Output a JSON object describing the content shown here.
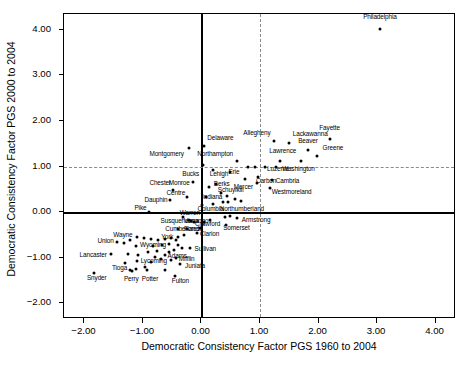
{
  "chart_data": {
    "type": "scatter",
    "title": "",
    "xlabel": "Democratic Consistency Factor PGS 1960 to 2004",
    "ylabel": "Democratic Consistency Factor PGS 2000 to 2004",
    "xlim": [
      -2.35,
      4.35
    ],
    "ylim": [
      -2.35,
      4.35
    ],
    "xticks": [
      -2.0,
      -1.0,
      0.0,
      1.0,
      2.0,
      3.0,
      4.0
    ],
    "xticklabels": [
      "-2.00",
      "-1.00",
      "0.00",
      "1.00",
      "2.00",
      "3.00",
      "4.00"
    ],
    "yticks": [
      -2.0,
      -1.0,
      0.0,
      1.0,
      2.0,
      3.0,
      4.0
    ],
    "yticklabels": [
      "-2.00",
      "-1.00",
      "0.00",
      "1.00",
      "2.00",
      "3.00",
      "4.00"
    ],
    "grid": false,
    "legend": null,
    "reference_lines": [
      {
        "axis": "x",
        "value": 0.0,
        "style": "solid",
        "color": "#000000"
      },
      {
        "axis": "y",
        "value": 0.0,
        "style": "solid",
        "color": "#000000"
      },
      {
        "axis": "x",
        "value": 1.0,
        "style": "dashed",
        "color": "#8a8a8a"
      },
      {
        "axis": "y",
        "value": 1.0,
        "style": "dashed",
        "color": "#8a8a8a"
      }
    ],
    "marker": {
      "shape": "circle",
      "color": "#000000",
      "size": 3
    },
    "points": [
      {
        "label": "Philadelphia",
        "x": 3.05,
        "y": 4.03,
        "lx": 3.05,
        "ly": 4.27,
        "anchor": "center"
      },
      {
        "label": "Fayette",
        "x": 2.19,
        "y": 1.61,
        "lx": 2.19,
        "ly": 1.84,
        "anchor": "center"
      },
      {
        "label": "Lackawanna",
        "x": 1.5,
        "y": 1.52,
        "lx": 1.56,
        "ly": 1.72,
        "anchor": "left"
      },
      {
        "label": "Allegheny",
        "x": 1.24,
        "y": 1.57,
        "lx": 1.18,
        "ly": 1.74,
        "anchor": "right"
      },
      {
        "label": "Beaver",
        "x": 1.82,
        "y": 1.37,
        "lx": 1.82,
        "ly": 1.56,
        "anchor": "center"
      },
      {
        "label": "Greene",
        "x": 1.97,
        "y": 1.22,
        "lx": 2.07,
        "ly": 1.4,
        "anchor": "left"
      },
      {
        "label": "Lawrence",
        "x": 1.7,
        "y": 1.12,
        "lx": 1.62,
        "ly": 1.33,
        "anchor": "right"
      },
      {
        "label": "Delaware",
        "x": 0.04,
        "y": 1.44,
        "lx": 0.1,
        "ly": 1.62,
        "anchor": "left"
      },
      {
        "label": "Montgomery",
        "x": -0.22,
        "y": 1.4,
        "lx": -0.3,
        "ly": 1.26,
        "anchor": "right"
      },
      {
        "label": "Northampton",
        "x": 0.6,
        "y": 1.13,
        "lx": 0.54,
        "ly": 1.28,
        "anchor": "right"
      },
      {
        "label": "Luzerne",
        "x": 1.08,
        "y": 1.0,
        "lx": 1.12,
        "ly": 0.94,
        "anchor": "left"
      },
      {
        "label": "Washington",
        "x": 1.28,
        "y": 0.99,
        "lx": 1.38,
        "ly": 0.94,
        "anchor": "left"
      },
      {
        "label": "Bucks",
        "x": 0.03,
        "y": 1.03,
        "lx": -0.04,
        "ly": 0.83,
        "anchor": "right"
      },
      {
        "label": "Lehigh",
        "x": 0.2,
        "y": 0.92,
        "lx": 0.14,
        "ly": 0.83,
        "anchor": "left"
      },
      {
        "label": "Erie",
        "x": 0.49,
        "y": 0.88,
        "lx": 0.46,
        "ly": 0.88,
        "anchor": "left"
      },
      {
        "label": "Carbon",
        "x": 0.97,
        "y": 0.77,
        "lx": 0.93,
        "ly": 0.68,
        "anchor": "left"
      },
      {
        "label": "Cambria",
        "x": 1.21,
        "y": 0.71,
        "lx": 1.27,
        "ly": 0.68,
        "anchor": "left"
      },
      {
        "label": "Mercer",
        "x": 0.95,
        "y": 0.63,
        "lx": 0.88,
        "ly": 0.55,
        "anchor": "right"
      },
      {
        "label": "Westmoreland",
        "x": 1.17,
        "y": 0.53,
        "lx": 1.2,
        "ly": 0.44,
        "anchor": "left"
      },
      {
        "label": "Monroe",
        "x": -0.14,
        "y": 0.66,
        "lx": -0.2,
        "ly": 0.63,
        "anchor": "right"
      },
      {
        "label": "Chester",
        "x": -0.49,
        "y": 0.48,
        "lx": -0.52,
        "ly": 0.63,
        "anchor": "right"
      },
      {
        "label": "Berks",
        "x": 0.24,
        "y": 0.62,
        "lx": 0.21,
        "ly": 0.62,
        "anchor": "left"
      },
      {
        "label": "Schuylkill",
        "x": 0.13,
        "y": 0.55,
        "lx": 0.28,
        "ly": 0.49,
        "anchor": "left"
      },
      {
        "label": "Centre",
        "x": -0.24,
        "y": 0.33,
        "lx": -0.28,
        "ly": 0.41,
        "anchor": "right"
      },
      {
        "label": "Indiana",
        "x": 0.07,
        "y": 0.34,
        "lx": 0.01,
        "ly": 0.33,
        "anchor": "left"
      },
      {
        "label": "Dauphin",
        "x": -0.53,
        "y": 0.27,
        "lx": -0.58,
        "ly": 0.27,
        "anchor": "right"
      },
      {
        "label": "Columbia",
        "x": 0.01,
        "y": 0.15,
        "lx": -0.07,
        "ly": 0.07,
        "anchor": "left"
      },
      {
        "label": "Northumberland",
        "x": 0.45,
        "y": 0.21,
        "lx": 0.31,
        "ly": 0.07,
        "anchor": "left"
      },
      {
        "label": "Pike",
        "x": -0.9,
        "y": 0.0,
        "lx": -0.94,
        "ly": 0.08,
        "anchor": "right"
      },
      {
        "label": "Warren",
        "x": -0.31,
        "y": -0.12,
        "lx": -0.37,
        "ly": -0.02,
        "anchor": "left"
      },
      {
        "label": "Armstrong",
        "x": 0.6,
        "y": -0.13,
        "lx": 0.69,
        "ly": -0.18,
        "anchor": "left"
      },
      {
        "label": "Susquehanna",
        "x": -0.22,
        "y": -0.18,
        "lx": -0.7,
        "ly": -0.21,
        "anchor": "left"
      },
      {
        "label": "Venango",
        "x": -0.18,
        "y": -0.2,
        "lx": -0.3,
        "ly": -0.21,
        "anchor": "left"
      },
      {
        "label": "Crawford",
        "x": -0.13,
        "y": -0.23,
        "lx": -0.11,
        "ly": -0.27,
        "anchor": "left"
      },
      {
        "label": "Somerset",
        "x": 0.42,
        "y": -0.29,
        "lx": 0.37,
        "ly": -0.36,
        "anchor": "left"
      },
      {
        "label": "Cumberland",
        "x": -0.4,
        "y": -0.38,
        "lx": -0.62,
        "ly": -0.38,
        "anchor": "left"
      },
      {
        "label": "Forest",
        "x": -0.25,
        "y": -0.37,
        "lx": -0.3,
        "ly": -0.38,
        "anchor": "left"
      },
      {
        "label": "Clarion",
        "x": -0.07,
        "y": -0.47,
        "lx": -0.03,
        "ly": -0.48,
        "anchor": "left"
      },
      {
        "label": "Wayne",
        "x": -1.1,
        "y": -0.55,
        "lx": -1.18,
        "ly": -0.5,
        "anchor": "right"
      },
      {
        "label": "York",
        "x": -0.44,
        "y": -0.62,
        "lx": -0.48,
        "ly": -0.56,
        "anchor": "right"
      },
      {
        "label": "Union",
        "x": -1.45,
        "y": -0.65,
        "lx": -1.5,
        "ly": -0.64,
        "anchor": "right"
      },
      {
        "label": "Wyoming",
        "x": -1.12,
        "y": -0.74,
        "lx": -1.05,
        "ly": -0.73,
        "anchor": "left"
      },
      {
        "label": "Sullivan",
        "x": -0.2,
        "y": -0.79,
        "lx": -0.12,
        "ly": -0.82,
        "anchor": "left"
      },
      {
        "label": "Lancaster",
        "x": -1.55,
        "y": -0.92,
        "lx": -1.62,
        "ly": -0.94,
        "anchor": "right"
      },
      {
        "label": "Adams",
        "x": -0.63,
        "y": -0.95,
        "lx": -0.58,
        "ly": -0.96,
        "anchor": "left"
      },
      {
        "label": "Mifflin",
        "x": -0.43,
        "y": -1.02,
        "lx": -0.39,
        "ly": -1.04,
        "anchor": "left"
      },
      {
        "label": "Lycoming",
        "x": -1.1,
        "y": -1.07,
        "lx": -1.04,
        "ly": -1.08,
        "anchor": "left"
      },
      {
        "label": "Juniata",
        "x": -0.36,
        "y": -1.15,
        "lx": -0.28,
        "ly": -1.2,
        "anchor": "left"
      },
      {
        "label": "Tioga",
        "x": -1.22,
        "y": -1.28,
        "lx": -1.27,
        "ly": -1.24,
        "anchor": "right"
      },
      {
        "label": "Snyder",
        "x": -1.84,
        "y": -1.34,
        "lx": -1.79,
        "ly": -1.46,
        "anchor": "center"
      },
      {
        "label": "Perry",
        "x": -1.19,
        "y": -1.3,
        "lx": -1.2,
        "ly": -1.47,
        "anchor": "center"
      },
      {
        "label": "Potter",
        "x": -0.93,
        "y": -1.28,
        "lx": -0.88,
        "ly": -1.47,
        "anchor": "center"
      },
      {
        "label": "Fulton",
        "x": -0.46,
        "y": -1.41,
        "lx": -0.36,
        "ly": -1.53,
        "anchor": "center"
      },
      {
        "label": "",
        "x": 1.35,
        "y": 1.12,
        "lx": null,
        "ly": null,
        "anchor": "center"
      },
      {
        "label": "",
        "x": 0.92,
        "y": 0.99,
        "lx": null,
        "ly": null,
        "anchor": "center"
      },
      {
        "label": "",
        "x": 0.74,
        "y": 0.73,
        "lx": null,
        "ly": null,
        "anchor": "center"
      },
      {
        "label": "",
        "x": 0.33,
        "y": 0.41,
        "lx": null,
        "ly": null,
        "anchor": "center"
      },
      {
        "label": "",
        "x": 0.43,
        "y": 0.35,
        "lx": null,
        "ly": null,
        "anchor": "center"
      },
      {
        "label": "",
        "x": 0.57,
        "y": 0.29,
        "lx": null,
        "ly": null,
        "anchor": "center"
      },
      {
        "label": "",
        "x": 0.68,
        "y": 0.24,
        "lx": null,
        "ly": null,
        "anchor": "center"
      },
      {
        "label": "",
        "x": 0.36,
        "y": 0.22,
        "lx": null,
        "ly": null,
        "anchor": "center"
      },
      {
        "label": "",
        "x": 0.2,
        "y": 0.18,
        "lx": null,
        "ly": null,
        "anchor": "center"
      },
      {
        "label": "",
        "x": 0.49,
        "y": -0.09,
        "lx": null,
        "ly": null,
        "anchor": "center"
      },
      {
        "label": "",
        "x": 0.4,
        "y": -0.12,
        "lx": null,
        "ly": null,
        "anchor": "center"
      },
      {
        "label": "",
        "x": 0.15,
        "y": -0.17,
        "lx": null,
        "ly": null,
        "anchor": "center"
      },
      {
        "label": "",
        "x": 0.05,
        "y": -0.23,
        "lx": null,
        "ly": null,
        "anchor": "center"
      },
      {
        "label": "",
        "x": -0.03,
        "y": -0.35,
        "lx": null,
        "ly": null,
        "anchor": "center"
      },
      {
        "label": "",
        "x": -0.3,
        "y": -0.5,
        "lx": null,
        "ly": null,
        "anchor": "center"
      },
      {
        "label": "",
        "x": -0.4,
        "y": -0.55,
        "lx": null,
        "ly": null,
        "anchor": "center"
      },
      {
        "label": "",
        "x": -0.52,
        "y": -0.56,
        "lx": null,
        "ly": null,
        "anchor": "center"
      },
      {
        "label": "",
        "x": -0.62,
        "y": -0.6,
        "lx": null,
        "ly": null,
        "anchor": "center"
      },
      {
        "label": "",
        "x": -0.74,
        "y": -0.62,
        "lx": null,
        "ly": null,
        "anchor": "center"
      },
      {
        "label": "",
        "x": -0.86,
        "y": -0.6,
        "lx": null,
        "ly": null,
        "anchor": "center"
      },
      {
        "label": "",
        "x": -0.98,
        "y": -0.57,
        "lx": null,
        "ly": null,
        "anchor": "center"
      },
      {
        "label": "",
        "x": -1.22,
        "y": -0.62,
        "lx": null,
        "ly": null,
        "anchor": "center"
      },
      {
        "label": "",
        "x": -1.33,
        "y": -0.69,
        "lx": null,
        "ly": null,
        "anchor": "center"
      },
      {
        "label": "",
        "x": -0.83,
        "y": -0.74,
        "lx": null,
        "ly": null,
        "anchor": "center"
      },
      {
        "label": "",
        "x": -0.68,
        "y": -0.72,
        "lx": null,
        "ly": null,
        "anchor": "center"
      },
      {
        "label": "",
        "x": -0.55,
        "y": -0.7,
        "lx": null,
        "ly": null,
        "anchor": "center"
      },
      {
        "label": "",
        "x": -0.41,
        "y": -0.72,
        "lx": null,
        "ly": null,
        "anchor": "center"
      },
      {
        "label": "",
        "x": -0.33,
        "y": -0.78,
        "lx": null,
        "ly": null,
        "anchor": "center"
      },
      {
        "label": "",
        "x": -0.47,
        "y": -0.84,
        "lx": null,
        "ly": null,
        "anchor": "center"
      },
      {
        "label": "",
        "x": -0.56,
        "y": -0.88,
        "lx": null,
        "ly": null,
        "anchor": "center"
      },
      {
        "label": "",
        "x": -0.76,
        "y": -0.86,
        "lx": null,
        "ly": null,
        "anchor": "center"
      },
      {
        "label": "",
        "x": -0.92,
        "y": -0.87,
        "lx": null,
        "ly": null,
        "anchor": "center"
      },
      {
        "label": "",
        "x": -1.25,
        "y": -0.92,
        "lx": null,
        "ly": null,
        "anchor": "center"
      },
      {
        "label": "",
        "x": -1.08,
        "y": -0.95,
        "lx": null,
        "ly": null,
        "anchor": "center"
      },
      {
        "label": "",
        "x": -0.8,
        "y": -0.99,
        "lx": null,
        "ly": null,
        "anchor": "center"
      },
      {
        "label": "",
        "x": -0.69,
        "y": -1.03,
        "lx": null,
        "ly": null,
        "anchor": "center"
      },
      {
        "label": "",
        "x": -0.52,
        "y": -1.06,
        "lx": null,
        "ly": null,
        "anchor": "center"
      },
      {
        "label": "",
        "x": -0.86,
        "y": -1.09,
        "lx": null,
        "ly": null,
        "anchor": "center"
      },
      {
        "label": "",
        "x": -1.31,
        "y": -1.12,
        "lx": null,
        "ly": null,
        "anchor": "center"
      },
      {
        "label": "",
        "x": -0.97,
        "y": -1.2,
        "lx": null,
        "ly": null,
        "anchor": "center"
      },
      {
        "label": "",
        "x": -1.12,
        "y": -1.25,
        "lx": null,
        "ly": null,
        "anchor": "center"
      },
      {
        "label": "",
        "x": -0.63,
        "y": -1.27,
        "lx": null,
        "ly": null,
        "anchor": "center"
      },
      {
        "label": "",
        "x": 0.8,
        "y": 1.0,
        "lx": null,
        "ly": null,
        "anchor": "center"
      }
    ]
  }
}
